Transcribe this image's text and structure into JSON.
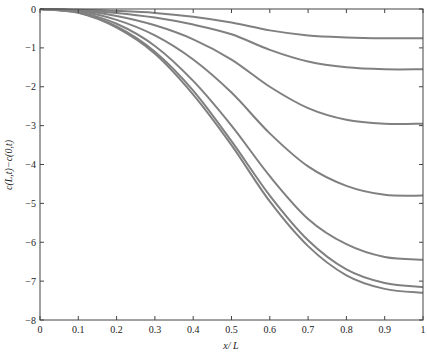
{
  "chart_data": {
    "type": "line",
    "title": "",
    "xlabel": "x/ L",
    "ylabel": "c(L,t)−c(0,t)",
    "xlim": [
      0,
      1
    ],
    "ylim": [
      -8,
      0
    ],
    "grid": false,
    "legend": null,
    "xticks": [
      "0",
      "0.1",
      "0.2",
      "0.3",
      "0.4",
      "0.5",
      "0.6",
      "0.7",
      "0.8",
      "0.9",
      "1"
    ],
    "yticks": [
      "0",
      "−1",
      "−2",
      "−3",
      "−4",
      "−5",
      "−6",
      "−7",
      "−8"
    ],
    "line_color": "#808080",
    "x": [
      0,
      0.1,
      0.2,
      0.3,
      0.4,
      0.5,
      0.6,
      0.7,
      0.8,
      0.9,
      1.0
    ],
    "series": [
      {
        "name": "curve-1",
        "values": [
          0,
          -0.02,
          -0.05,
          -0.1,
          -0.2,
          -0.35,
          -0.55,
          -0.68,
          -0.73,
          -0.75,
          -0.75
        ]
      },
      {
        "name": "curve-2",
        "values": [
          0,
          -0.03,
          -0.1,
          -0.22,
          -0.4,
          -0.65,
          -1.05,
          -1.35,
          -1.5,
          -1.55,
          -1.55
        ]
      },
      {
        "name": "curve-3",
        "values": [
          0,
          -0.04,
          -0.18,
          -0.42,
          -0.78,
          -1.3,
          -2.0,
          -2.55,
          -2.85,
          -2.95,
          -2.95
        ]
      },
      {
        "name": "curve-4",
        "values": [
          0,
          -0.06,
          -0.28,
          -0.68,
          -1.3,
          -2.15,
          -3.2,
          -4.05,
          -4.55,
          -4.78,
          -4.8
        ]
      },
      {
        "name": "curve-5",
        "values": [
          0,
          -0.08,
          -0.38,
          -0.95,
          -1.85,
          -3.0,
          -4.3,
          -5.4,
          -6.05,
          -6.38,
          -6.45
        ]
      },
      {
        "name": "curve-6",
        "values": [
          0,
          -0.09,
          -0.45,
          -1.1,
          -2.1,
          -3.4,
          -4.8,
          -5.95,
          -6.7,
          -7.05,
          -7.15
        ]
      },
      {
        "name": "curve-7",
        "values": [
          0,
          -0.1,
          -0.48,
          -1.15,
          -2.2,
          -3.5,
          -4.95,
          -6.1,
          -6.85,
          -7.2,
          -7.3
        ]
      }
    ]
  }
}
